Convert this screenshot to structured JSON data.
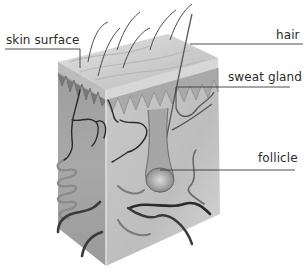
{
  "diagram": {
    "labels": [
      {
        "id": "skin-surface",
        "text": "skin surface"
      },
      {
        "id": "hair",
        "text": "hair"
      },
      {
        "id": "sweat-gland",
        "text": "sweat gland"
      },
      {
        "id": "follicle",
        "text": "follicle"
      }
    ],
    "colors": {
      "background": "#ffffff",
      "label_text": "#2b2b2b",
      "leader_line": "#3a3a3a",
      "epidermis_top": "#cfcfcf",
      "block_left_face": "#9a9a9a",
      "block_right_face": "#c2c2c2",
      "vessel": "#2a2a2a"
    }
  }
}
